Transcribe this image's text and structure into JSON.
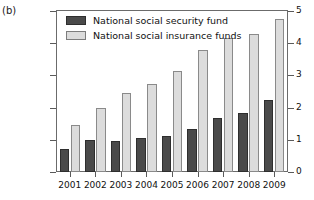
{
  "figure": {
    "panel_label": "(b)"
  },
  "legend": {
    "position": "top-left-inside",
    "items": [
      {
        "label": "National social security fund",
        "color": "#4a4a4a",
        "swatch": "dark-swatch"
      },
      {
        "label": "National social insurance funds",
        "color": "#dcdcdc",
        "swatch": "light-swatch"
      }
    ]
  },
  "axes": {
    "y_ticks": [
      "0",
      "1",
      "2",
      "3",
      "4",
      "5"
    ],
    "y_side": "right",
    "x_ticks": [
      "2001",
      "2002",
      "2003",
      "2004",
      "2005",
      "2006",
      "2007",
      "2008",
      "2009"
    ]
  },
  "chart_data": {
    "type": "bar",
    "title": "",
    "xlabel": "",
    "ylabel": "",
    "ylim": [
      0,
      5
    ],
    "yticks": [
      0,
      1,
      2,
      3,
      4,
      5
    ],
    "grid": false,
    "legend_position": "upper left",
    "categories": [
      "2001",
      "2002",
      "2003",
      "2004",
      "2005",
      "2006",
      "2007",
      "2008",
      "2009"
    ],
    "series": [
      {
        "name": "National social security fund",
        "color": "#4a4a4a",
        "values": [
          0.72,
          1.0,
          0.95,
          1.05,
          1.12,
          1.35,
          1.68,
          1.82,
          2.25
        ]
      },
      {
        "name": "National social insurance funds",
        "color": "#dcdcdc",
        "values": [
          1.45,
          1.98,
          2.45,
          2.72,
          3.15,
          3.78,
          4.15,
          4.3,
          4.75
        ]
      }
    ]
  }
}
